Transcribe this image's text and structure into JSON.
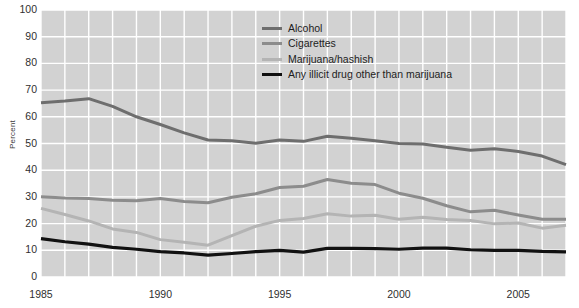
{
  "chart_data": {
    "type": "line",
    "title": "",
    "xlabel": "",
    "ylabel": "Percent",
    "xlim": [
      1985,
      2007
    ],
    "ylim": [
      0,
      100
    ],
    "grid": true,
    "legend_position": "top-center-right",
    "x": [
      1985,
      1986,
      1987,
      1988,
      1989,
      1990,
      1991,
      1992,
      1993,
      1994,
      1995,
      1996,
      1997,
      1998,
      1999,
      2000,
      2001,
      2002,
      2003,
      2004,
      2005,
      2006,
      2007
    ],
    "yticks": [
      0,
      10,
      20,
      30,
      40,
      50,
      60,
      70,
      80,
      90,
      100
    ],
    "xticks": [
      1985,
      1990,
      1995,
      2000,
      2005
    ],
    "series": [
      {
        "name": "Alcohol",
        "color": "#6e6e6e",
        "width": 3.0,
        "values": [
          65.3,
          65.9,
          66.8,
          63.9,
          60.0,
          57.1,
          54.0,
          51.3,
          51.0,
          50.1,
          51.3,
          50.8,
          52.7,
          52.0,
          51.0,
          50.0,
          49.8,
          48.6,
          47.5,
          48.0,
          47.0,
          45.3,
          42.1
        ]
      },
      {
        "name": "Cigarettes",
        "color": "#8c8c8c",
        "width": 3.0,
        "values": [
          30.1,
          29.6,
          29.4,
          28.7,
          28.6,
          29.4,
          28.3,
          27.8,
          29.9,
          31.2,
          33.5,
          34.0,
          36.5,
          35.1,
          34.6,
          31.4,
          29.5,
          26.7,
          24.4,
          25.0,
          23.2,
          21.6,
          21.6
        ]
      },
      {
        "name": "Marijuana/hashish",
        "color": "#b4b4b4",
        "width": 3.0,
        "values": [
          25.7,
          23.4,
          21.0,
          18.0,
          16.7,
          14.0,
          13.0,
          11.9,
          15.5,
          19.0,
          21.2,
          21.9,
          23.7,
          22.8,
          23.1,
          21.6,
          22.4,
          21.5,
          21.2,
          19.9,
          20.2,
          18.3,
          19.4
        ]
      },
      {
        "name": "Any illicit drug other than marijuana",
        "color": "#111111",
        "width": 3.2,
        "values": [
          14.4,
          13.2,
          12.3,
          11.1,
          10.4,
          9.5,
          9.0,
          8.2,
          8.8,
          9.5,
          10.0,
          9.3,
          10.7,
          10.7,
          10.6,
          10.4,
          10.8,
          10.8,
          10.2,
          10.0,
          10.0,
          9.6,
          9.4
        ]
      }
    ],
    "plot_bg": "#d2d2d2",
    "grid_color": "#ffffff"
  },
  "axis": {
    "y_label": "Percent",
    "y_ticks": [
      "100",
      "90",
      "80",
      "70",
      "60",
      "50",
      "40",
      "30",
      "20",
      "10",
      "0"
    ],
    "x_ticks": [
      "1985",
      "1990",
      "1995",
      "2000",
      "2005"
    ]
  },
  "legend": {
    "items": [
      {
        "label": "Alcohol",
        "color": "#6e6e6e"
      },
      {
        "label": "Cigarettes",
        "color": "#8c8c8c"
      },
      {
        "label": "Marijuana/hashish",
        "color": "#b4b4b4"
      },
      {
        "label": "Any illicit drug other than marijuana",
        "color": "#111111"
      }
    ]
  }
}
